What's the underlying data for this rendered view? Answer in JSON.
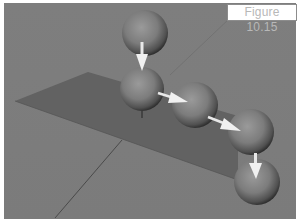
{
  "figure": {
    "label": "Figure 10.15"
  },
  "scene": {
    "background_color": "#7a7a7a",
    "plane_color": "#5f5f5f",
    "sphere_color": "#7b7b7b",
    "arrow_color": "#f2f2f2",
    "spheres": [
      {
        "id": 1,
        "cx": 145,
        "cy": 33,
        "r": 23
      },
      {
        "id": 2,
        "cx": 142,
        "cy": 89,
        "r": 22
      },
      {
        "id": 3,
        "cx": 195,
        "cy": 105,
        "r": 23
      },
      {
        "id": 4,
        "cx": 251,
        "cy": 132,
        "r": 23
      },
      {
        "id": 5,
        "cx": 257,
        "cy": 182,
        "r": 23
      }
    ],
    "arrows": [
      {
        "from": 1,
        "to": 2
      },
      {
        "from": 2,
        "to": 3
      },
      {
        "from": 3,
        "to": 4
      },
      {
        "from": 4,
        "to": 5
      }
    ]
  }
}
